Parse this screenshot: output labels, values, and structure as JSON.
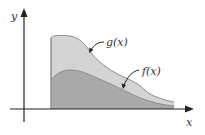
{
  "figure": {
    "type": "area-between-curves",
    "axes": {
      "x_label": "x",
      "y_label": "y"
    },
    "curves": [
      {
        "name": "g(x)",
        "label": "g(x)",
        "role": "upper"
      },
      {
        "name": "f(x)",
        "label": "f(x)",
        "role": "lower"
      }
    ],
    "colors": {
      "axis": "#222222",
      "upper_fill": "#d4d4d4",
      "lower_fill": "#a9a9a9",
      "curve_stroke": "#8c8c8c",
      "label": "#333333"
    }
  }
}
